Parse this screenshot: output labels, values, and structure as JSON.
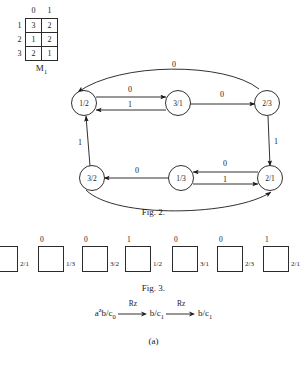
{
  "matrix": {
    "name": "M",
    "name_sub": "1",
    "col_headers": [
      "0",
      "1"
    ],
    "row_headers": [
      "1",
      "2",
      "3"
    ],
    "rows": [
      [
        "3",
        "2"
      ],
      [
        "1",
        "2"
      ],
      [
        "2",
        "1"
      ]
    ]
  },
  "fig2": {
    "caption": "Fig. 2.",
    "nodes": [
      {
        "id": "n12",
        "label": "1/2",
        "cx": 84,
        "cy": 47
      },
      {
        "id": "n31",
        "label": "3/1",
        "cx": 178,
        "cy": 47
      },
      {
        "id": "n23",
        "label": "2/3",
        "cx": 267,
        "cy": 47
      },
      {
        "id": "n32",
        "label": "3/2",
        "cx": 92,
        "cy": 122
      },
      {
        "id": "n13",
        "label": "1/3",
        "cx": 181,
        "cy": 122
      },
      {
        "id": "n21",
        "label": "2/1",
        "cx": 270,
        "cy": 122
      }
    ],
    "edges": [
      {
        "from": "1/2",
        "to": "3/1",
        "label": "0"
      },
      {
        "from": "3/1",
        "to": "1/2",
        "label": "1"
      },
      {
        "from": "3/1",
        "to": "2/3",
        "label": "0"
      },
      {
        "from": "2/3",
        "to": "1/2",
        "label": "0"
      },
      {
        "from": "2/3",
        "to": "2/1",
        "label": "1"
      },
      {
        "from": "2/1",
        "to": "1/3",
        "label": "0"
      },
      {
        "from": "1/3",
        "to": "2/1",
        "label": "1"
      },
      {
        "from": "1/3",
        "to": "3/2",
        "label": "0"
      },
      {
        "from": "3/2",
        "to": "1/2",
        "label": "1"
      },
      {
        "from": "3/2",
        "to": "2/1",
        "label": ""
      }
    ],
    "edge_labels": {
      "top_arc": "0",
      "e_12_31": "0",
      "e_31_12": "1",
      "e_31_23": "0",
      "e_23_21": "1",
      "e_21_13": "0",
      "e_13_21": "1",
      "e_13_32": "0",
      "e_32_12": "1"
    }
  },
  "fig3": {
    "caption": "Fig. 3.",
    "cells": [
      {
        "top": "1",
        "right": "2/1"
      },
      {
        "top": "0",
        "right": "1/3"
      },
      {
        "top": "0",
        "right": "3/2"
      },
      {
        "top": "1",
        "right": "1/2"
      },
      {
        "top": "0",
        "right": "3/1"
      },
      {
        "top": "0",
        "right": "2/3"
      },
      {
        "top": "1",
        "right": "2/1"
      }
    ]
  },
  "formula": {
    "term1_base": "a",
    "term1_sup": "z",
    "term1_rest": "b/c",
    "term1_sub": "0",
    "arrow1_label": "Rz",
    "term2_base": "b/c",
    "term2_sub": "1",
    "arrow2_label": "Rz",
    "term3_base": "b/c",
    "term3_sub": "1",
    "caption": "(a)"
  }
}
